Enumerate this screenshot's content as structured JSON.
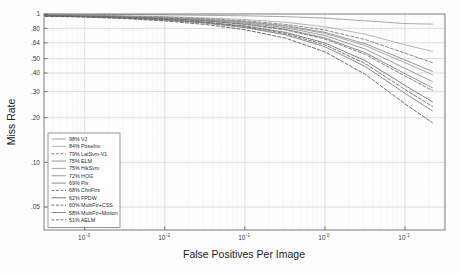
{
  "figure": {
    "title": "",
    "background_color": "#fdfdfd"
  },
  "axes": {
    "xlabel": "False Positives Per Image",
    "ylabel": "Miss Rate",
    "x_ticks": [
      {
        "label": "10",
        "exp": "-3",
        "value": 0.001
      },
      {
        "label": "10",
        "exp": "-2",
        "value": 0.01
      },
      {
        "label": "10",
        "exp": "-1",
        "value": 0.1
      },
      {
        "label": "10",
        "exp": "0",
        "value": 1
      },
      {
        "label": "10",
        "exp": "1",
        "value": 10
      }
    ],
    "y_ticks": [
      {
        "label": "1",
        "value": 1.0
      },
      {
        "label": ".80",
        "value": 0.8
      },
      {
        "label": ".64",
        "value": 0.64
      },
      {
        "label": ".50",
        "value": 0.5
      },
      {
        "label": ".40",
        "value": 0.4
      },
      {
        "label": ".30",
        "value": 0.3
      },
      {
        "label": ".20",
        "value": 0.2
      },
      {
        "label": ".10",
        "value": 0.1
      },
      {
        "label": ".05",
        "value": 0.05
      }
    ],
    "xlim": [
      0.00031,
      31.6
    ],
    "ylim": [
      0.035,
      1.0
    ],
    "xscale": "log",
    "yscale": "log",
    "grid": true
  },
  "legend": {
    "position": "lower-left",
    "entries": [
      {
        "label": "98% VJ",
        "style": "solid",
        "color": "#9a9a9a"
      },
      {
        "label": "84% PoseInv",
        "style": "solid",
        "color": "#aaaaaa"
      },
      {
        "label": "79% LatSvm-V1",
        "style": "dashed",
        "color": "#777777"
      },
      {
        "label": "75% ELM",
        "style": "solid",
        "color": "#888888"
      },
      {
        "label": "75% HikSvm",
        "style": "solid",
        "color": "#999999"
      },
      {
        "label": "72% HOG",
        "style": "solid",
        "color": "#8a8a8a"
      },
      {
        "label": "69% Pls",
        "style": "solid",
        "color": "#7e7e7e"
      },
      {
        "label": "68% ChnFtrs",
        "style": "dashed",
        "color": "#6e6e6e"
      },
      {
        "label": "62% FPDW",
        "style": "solid",
        "color": "#6a6a6a"
      },
      {
        "label": "60% MultiFtr+CSS",
        "style": "dashed",
        "color": "#5e5e5e"
      },
      {
        "label": "58% MultiFtr+Motion",
        "style": "solid",
        "color": "#7a7a7a"
      },
      {
        "label": "51% AELM",
        "style": "dashed",
        "color": "#555555"
      }
    ]
  },
  "chart_data": {
    "type": "line",
    "title": "",
    "xlabel": "False Positives Per Image",
    "ylabel": "Miss Rate",
    "xscale": "log",
    "yscale": "log",
    "xlim": [
      0.00031,
      31.6
    ],
    "ylim": [
      0.035,
      1.0
    ],
    "grid": true,
    "legend_position": "lower-left",
    "x": [
      0.00032,
      0.001,
      0.0032,
      0.01,
      0.032,
      0.1,
      0.32,
      1.0,
      3.2,
      10.0,
      22.0
    ],
    "series": [
      {
        "name": "98% VJ",
        "log_average_miss_rate": 98,
        "style": "solid",
        "values": [
          0.995,
          0.993,
          0.99,
          0.986,
          0.98,
          0.972,
          0.96,
          0.938,
          0.9,
          0.862,
          0.855
        ]
      },
      {
        "name": "84% PoseInv",
        "log_average_miss_rate": 84,
        "style": "solid",
        "values": [
          0.985,
          0.98,
          0.972,
          0.96,
          0.942,
          0.918,
          0.88,
          0.82,
          0.73,
          0.62,
          0.56
        ]
      },
      {
        "name": "79% LatSvm-V1",
        "log_average_miss_rate": 79,
        "style": "dashed",
        "values": [
          0.982,
          0.976,
          0.966,
          0.952,
          0.93,
          0.9,
          0.852,
          0.78,
          0.672,
          0.545,
          0.47
        ]
      },
      {
        "name": "75% ELM",
        "log_average_miss_rate": 75,
        "style": "solid",
        "values": [
          0.98,
          0.973,
          0.962,
          0.946,
          0.922,
          0.888,
          0.835,
          0.752,
          0.63,
          0.49,
          0.41
        ]
      },
      {
        "name": "75% HikSvm",
        "log_average_miss_rate": 75,
        "style": "solid",
        "values": [
          0.979,
          0.972,
          0.96,
          0.944,
          0.918,
          0.882,
          0.826,
          0.74,
          0.612,
          0.47,
          0.39
        ]
      },
      {
        "name": "72% HOG",
        "log_average_miss_rate": 72,
        "style": "solid",
        "values": [
          0.978,
          0.97,
          0.957,
          0.938,
          0.91,
          0.87,
          0.81,
          0.716,
          0.58,
          0.43,
          0.35
        ]
      },
      {
        "name": "69% Pls",
        "log_average_miss_rate": 69,
        "style": "solid",
        "values": [
          0.976,
          0.967,
          0.953,
          0.932,
          0.9,
          0.856,
          0.79,
          0.69,
          0.548,
          0.396,
          0.318
        ]
      },
      {
        "name": "68% ChnFtrs",
        "log_average_miss_rate": 68,
        "style": "dashed",
        "values": [
          0.975,
          0.966,
          0.951,
          0.929,
          0.896,
          0.85,
          0.782,
          0.678,
          0.534,
          0.382,
          0.305
        ]
      },
      {
        "name": "62% FPDW",
        "log_average_miss_rate": 62,
        "style": "solid",
        "values": [
          0.972,
          0.962,
          0.945,
          0.92,
          0.882,
          0.83,
          0.752,
          0.638,
          0.484,
          0.33,
          0.256
        ]
      },
      {
        "name": "60% MultiFtr+CSS",
        "log_average_miss_rate": 60,
        "style": "dashed",
        "values": [
          0.971,
          0.96,
          0.942,
          0.915,
          0.875,
          0.82,
          0.738,
          0.62,
          0.462,
          0.31,
          0.238
        ]
      },
      {
        "name": "58% MultiFtr+Motion",
        "log_average_miss_rate": 58,
        "style": "solid",
        "values": [
          0.97,
          0.958,
          0.939,
          0.91,
          0.868,
          0.81,
          0.724,
          0.602,
          0.442,
          0.292,
          0.222
        ]
      },
      {
        "name": "51% AELM",
        "log_average_miss_rate": 51,
        "style": "dashed",
        "values": [
          0.966,
          0.953,
          0.931,
          0.898,
          0.85,
          0.784,
          0.688,
          0.556,
          0.392,
          0.248,
          0.185
        ]
      }
    ]
  }
}
